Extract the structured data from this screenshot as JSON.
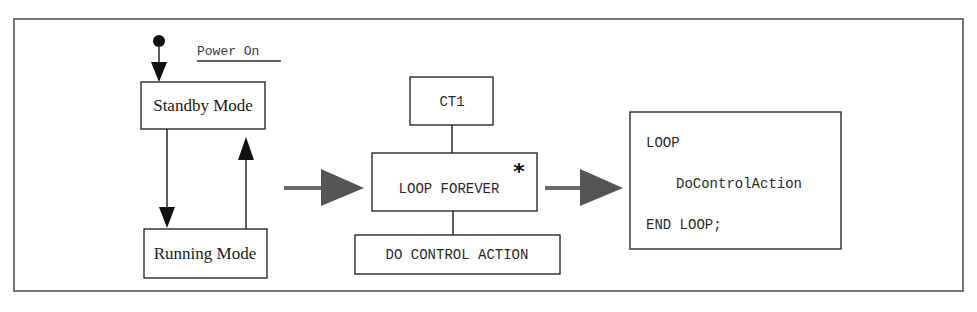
{
  "diagram": {
    "state_machine": {
      "initial_label": "Power On",
      "states": [
        {
          "id": "standby",
          "label": "Standby Mode"
        },
        {
          "id": "running",
          "label": "Running Mode"
        }
      ],
      "transitions": [
        {
          "from": "initial",
          "to": "standby"
        },
        {
          "from": "standby",
          "to": "running"
        },
        {
          "from": "running",
          "to": "standby"
        }
      ]
    },
    "structure_chart": {
      "top": "CT1",
      "middle": "LOOP FOREVER",
      "iteration_marker": "*",
      "bottom": "DO CONTROL ACTION"
    },
    "code": {
      "lines": [
        "LOOP",
        "DoControlAction",
        "END LOOP;"
      ]
    },
    "colors": {
      "line": "#1a1a1a",
      "block_arrow": "#555555",
      "frame": "#555555"
    }
  }
}
